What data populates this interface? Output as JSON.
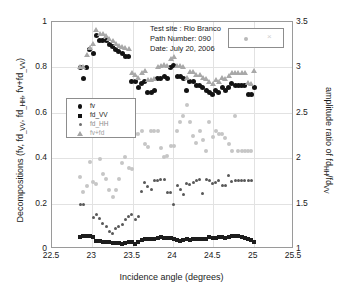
{
  "chart_data": {
    "type": "scatter",
    "title": "",
    "xlabel": "Incidence angle (degrees)",
    "ylabel": "Decompositions (fv, fd_VV, fd_HH, fv+fd_VV)",
    "ylabel_right": "amplitude ratio of fd_HH/fd_VV",
    "xlim": [
      22.5,
      25.5
    ],
    "ylim": [
      0,
      1
    ],
    "ylim_right": [
      1,
      3.5
    ],
    "xticks": [
      "22.5",
      "23",
      "23.5",
      "24",
      "24.5",
      "25",
      "25.5"
    ],
    "xtick_values": [
      22.5,
      23,
      23.5,
      24,
      24.5,
      25,
      25.5
    ],
    "yticks_left": [
      "0",
      "0.2",
      "0.4",
      "0.6",
      "0.8",
      "1"
    ],
    "ytick_values_left": [
      0,
      0.2,
      0.4,
      0.6,
      0.8,
      1
    ],
    "yticks_right": [
      "1",
      "1.5",
      "2",
      "2.5",
      "3",
      "3.5"
    ],
    "ytick_values_right": [
      1,
      1.5,
      2,
      2.5,
      3,
      3.5
    ],
    "grid": true,
    "legend_position": "middle-left",
    "annotation": {
      "line1": "Test site : Rio Branco",
      "line2": "Path Number: 090",
      "line3": "Date: July 20, 2006"
    },
    "legend": [
      {
        "label": "fv",
        "marker": "circle",
        "color": "#131313"
      },
      {
        "label": "fd_VV",
        "marker": "square",
        "color": "#1d1d1d"
      },
      {
        "label": "fd_HH",
        "marker": "dot",
        "color": "#585858"
      },
      {
        "label": "fv+fd",
        "marker": "triangle",
        "color": "#a8a8a8"
      }
    ],
    "marker_box": {
      "dot_color": "#b9b9b9",
      "x_color": "#d0d0d0",
      "x_glyph": "×"
    },
    "series": [
      {
        "name": "fv",
        "marker": "circle",
        "color": "#131313",
        "axis": "left",
        "x": [
          22.85,
          22.89,
          22.93,
          22.97,
          23.01,
          23.05,
          23.09,
          23.13,
          23.17,
          23.21,
          23.25,
          23.29,
          23.33,
          23.37,
          23.41,
          23.45,
          23.49,
          23.53,
          23.57,
          23.61,
          23.65,
          23.69,
          23.73,
          23.77,
          23.81,
          23.85,
          23.89,
          23.93,
          23.97,
          24.01,
          24.05,
          24.09,
          24.13,
          24.17,
          24.21,
          24.25,
          24.29,
          24.33,
          24.37,
          24.41,
          24.45,
          24.49,
          24.53,
          24.57,
          24.61,
          24.65,
          24.69,
          24.73,
          24.77,
          24.81,
          24.85,
          24.89,
          24.93,
          24.97,
          25.01
        ],
        "y": [
          0.8,
          0.75,
          0.8,
          0.88,
          0.86,
          0.94,
          0.92,
          0.92,
          0.92,
          0.9,
          0.89,
          0.88,
          0.87,
          0.86,
          0.85,
          0.85,
          0.74,
          0.74,
          0.71,
          0.73,
          0.74,
          0.69,
          0.69,
          0.7,
          0.75,
          0.75,
          0.76,
          0.75,
          0.8,
          0.81,
          0.76,
          0.76,
          0.75,
          0.7,
          0.74,
          0.74,
          0.72,
          0.72,
          0.71,
          0.7,
          0.69,
          0.68,
          0.7,
          0.69,
          0.71,
          0.7,
          0.71,
          0.73,
          0.72,
          0.72,
          0.72,
          0.72,
          0.68,
          0.68,
          0.71
        ]
      },
      {
        "name": "fd_VV",
        "marker": "square",
        "color": "#1d1d1d",
        "axis": "left",
        "x": [
          22.85,
          22.89,
          22.93,
          22.97,
          23.01,
          23.05,
          23.09,
          23.13,
          23.17,
          23.21,
          23.25,
          23.29,
          23.33,
          23.37,
          23.41,
          23.45,
          23.49,
          23.53,
          23.57,
          23.61,
          23.65,
          23.69,
          23.73,
          23.77,
          23.81,
          23.85,
          23.89,
          23.93,
          23.97,
          24.01,
          24.05,
          24.09,
          24.13,
          24.17,
          24.21,
          24.25,
          24.29,
          24.33,
          24.37,
          24.41,
          24.45,
          24.49,
          24.53,
          24.57,
          24.61,
          24.65,
          24.69,
          24.73,
          24.77,
          24.81,
          24.85,
          24.89,
          24.93,
          24.97,
          25.01
        ],
        "y": [
          0.055,
          0.057,
          0.056,
          0.057,
          0.055,
          0.036,
          0.035,
          0.033,
          0.031,
          0.03,
          0.028,
          0.026,
          0.025,
          0.024,
          0.026,
          0.03,
          0.033,
          0.022,
          0.032,
          0.038,
          0.043,
          0.045,
          0.044,
          0.046,
          0.05,
          0.052,
          0.05,
          0.049,
          0.048,
          0.046,
          0.038,
          0.036,
          0.04,
          0.042,
          0.041,
          0.043,
          0.045,
          0.044,
          0.043,
          0.046,
          0.055,
          0.048,
          0.05,
          0.053,
          0.052,
          0.05,
          0.055,
          0.057,
          0.058,
          0.057,
          0.054,
          0.05,
          0.045,
          0.04,
          0.03
        ]
      },
      {
        "name": "fd_HH",
        "marker": "dot",
        "color": "#585858",
        "axis": "left",
        "x": [
          22.85,
          22.89,
          23.01,
          23.05,
          23.09,
          23.13,
          23.17,
          23.21,
          23.25,
          23.29,
          23.33,
          23.37,
          23.41,
          23.45,
          23.49,
          23.53,
          23.57,
          23.61,
          23.65,
          23.69,
          23.73,
          23.77,
          23.81,
          23.85,
          23.89,
          23.93,
          23.97,
          24.01,
          24.05,
          24.09,
          24.13,
          24.17,
          24.21,
          24.25,
          24.29,
          24.33,
          24.37,
          24.41,
          24.45,
          24.49,
          24.53,
          24.57,
          24.61,
          24.65,
          24.69,
          24.73,
          24.77,
          24.81,
          24.85,
          24.89,
          24.93,
          24.97
        ],
        "y": [
          0.195,
          0.195,
          0.138,
          0.152,
          0.135,
          0.112,
          0.098,
          0.075,
          0.07,
          0.09,
          0.098,
          0.11,
          0.13,
          0.142,
          0.152,
          0.128,
          0.142,
          0.255,
          0.295,
          0.275,
          0.262,
          0.3,
          0.3,
          0.305,
          0.305,
          0.248,
          0.248,
          0.195,
          0.28,
          0.262,
          0.24,
          0.288,
          0.285,
          0.295,
          0.302,
          0.305,
          0.245,
          0.305,
          0.302,
          0.288,
          0.292,
          0.3,
          0.278,
          0.278,
          0.325,
          0.298,
          0.3,
          0.3,
          0.3,
          0.3,
          0.3,
          0.3
        ]
      },
      {
        "name": "fv+fd",
        "marker": "triangle",
        "color": "#a8a8a8",
        "axis": "left",
        "x": [
          22.85,
          22.89,
          22.93,
          22.97,
          23.01,
          23.05,
          23.09,
          23.13,
          23.17,
          23.21,
          23.25,
          23.29,
          23.33,
          23.37,
          23.41,
          23.45,
          23.49,
          23.53,
          23.57,
          23.61,
          23.65,
          23.69,
          23.73,
          23.77,
          23.81,
          23.85,
          23.89,
          23.93,
          23.97,
          24.01,
          24.05,
          24.09,
          24.13,
          24.17,
          24.21,
          24.25,
          24.29,
          24.33,
          24.37,
          24.41,
          24.45,
          24.49,
          24.53,
          24.57,
          24.61,
          24.65,
          24.69,
          24.73,
          24.77,
          24.81,
          24.85,
          24.89,
          24.93,
          24.97,
          25.01
        ],
        "y": [
          0.8,
          0.8,
          0.855,
          0.885,
          0.905,
          0.965,
          0.945,
          0.945,
          0.94,
          0.925,
          0.915,
          0.905,
          0.895,
          0.89,
          0.885,
          0.88,
          0.775,
          0.765,
          0.755,
          0.775,
          0.785,
          0.745,
          0.745,
          0.75,
          0.8,
          0.805,
          0.81,
          0.805,
          0.835,
          0.845,
          0.805,
          0.805,
          0.8,
          0.755,
          0.78,
          0.78,
          0.765,
          0.765,
          0.755,
          0.75,
          0.735,
          0.725,
          0.745,
          0.735,
          0.755,
          0.75,
          0.76,
          0.775,
          0.775,
          0.775,
          0.775,
          0.775,
          0.73,
          0.725,
          0.785
        ]
      },
      {
        "name": "amplitude-ratio",
        "marker": "dot",
        "color": "#c6c6c6",
        "axis": "right",
        "x": [
          22.85,
          22.89,
          22.93,
          22.97,
          23.01,
          23.05,
          23.09,
          23.13,
          23.17,
          23.21,
          23.25,
          23.29,
          23.33,
          23.37,
          23.41,
          23.45,
          23.49,
          23.53,
          23.57,
          23.61,
          23.65,
          23.69,
          23.73,
          23.77,
          23.81,
          23.85,
          23.89,
          23.93,
          23.97,
          24.01,
          24.05,
          24.09,
          24.13,
          24.17,
          24.21,
          24.25,
          24.29,
          24.33,
          24.37,
          24.41,
          24.45,
          24.49,
          24.53,
          24.57,
          24.61,
          24.65,
          24.69,
          24.73,
          24.77,
          24.81,
          24.85,
          24.89,
          24.93,
          24.97
        ],
        "y_left_equiv": [
          0.315,
          0.25,
          0.278,
          0.385,
          0.293,
          0.287,
          0.398,
          0.33,
          0.308,
          0.258,
          0.227,
          0.262,
          0.31,
          0.378,
          0.405,
          0.358,
          0.352,
          0.505,
          0.505,
          0.518,
          0.462,
          0.45,
          0.52,
          0.52,
          0.52,
          0.445,
          0.405,
          0.408,
          0.455,
          0.455,
          0.52,
          0.56,
          0.585,
          0.635,
          0.56,
          0.5,
          0.465,
          0.52,
          0.482,
          0.43,
          0.558,
          0.495,
          0.52,
          0.505,
          0.508,
          0.487,
          0.462,
          0.43,
          0.585,
          0.43,
          0.43,
          0.43,
          0.43,
          0.43
        ]
      }
    ]
  }
}
